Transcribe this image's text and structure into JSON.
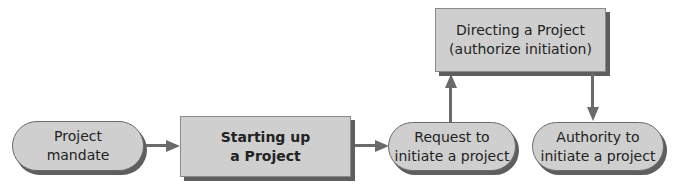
{
  "nodes": {
    "project_mandate": {
      "line1": "Project",
      "line2": "mandate"
    },
    "starting_up": {
      "line1": "Starting up",
      "line2": "a Project"
    },
    "request": {
      "line1": "Request to",
      "line2": "initiate a project"
    },
    "directing": {
      "line1": "Directing a Project",
      "line2": "(authorize initiation)"
    },
    "authority": {
      "line1": "Authority to",
      "line2": "initiate a project"
    }
  },
  "edges": [
    {
      "from": "project_mandate",
      "to": "starting_up"
    },
    {
      "from": "starting_up",
      "to": "request"
    },
    {
      "from": "request",
      "to": "directing"
    },
    {
      "from": "directing",
      "to": "authority"
    }
  ],
  "colors": {
    "fill": "#cfcfcf",
    "stroke": "#6a6a6a",
    "shadow": "#5e5e5e",
    "text": "#222222"
  }
}
